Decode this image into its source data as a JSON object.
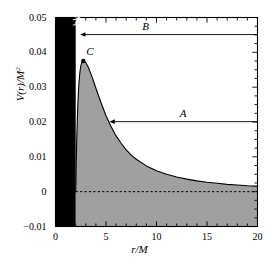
{
  "chart_data": {
    "type": "area",
    "title": "",
    "xlabel": "r/M",
    "ylabel": "V(r)/M2",
    "ylabel_base": "V(r)/M",
    "ylabel_exponent": "2",
    "xlim": [
      0,
      20
    ],
    "ylim": [
      -0.01,
      0.05
    ],
    "xticks": [
      0,
      5,
      10,
      15,
      20
    ],
    "xtick_labels": [
      "0",
      "5",
      "10",
      "15",
      "20"
    ],
    "xticks_minor_step": 1,
    "yticks": [
      -0.01,
      0,
      0.01,
      0.02,
      0.03,
      0.04,
      0.05
    ],
    "ytick_labels": [
      "-0.01",
      "0",
      "0.01",
      "0.02",
      "0.03",
      "0.04",
      "0.05"
    ],
    "yticks_minor_step": 0.0025,
    "grid": false,
    "legend": "none",
    "series": [
      {
        "name": "effective-potential",
        "fill_color": "#a0a0a0",
        "line_color": "#000000",
        "x": [
          2.0,
          2.1,
          2.2,
          2.3,
          2.4,
          2.5,
          2.6,
          2.7,
          2.8,
          2.9,
          3.0,
          3.2,
          3.4,
          3.6,
          3.8,
          4.0,
          4.5,
          5.0,
          5.5,
          6.0,
          6.5,
          7.0,
          7.5,
          8.0,
          9.0,
          10.0,
          11.0,
          12.0,
          13.0,
          14.0,
          15.0,
          16.0,
          17.0,
          18.0,
          19.0,
          20.0
        ],
        "y": [
          0.0,
          0.0148,
          0.0242,
          0.0302,
          0.0339,
          0.036,
          0.0371,
          0.0375,
          0.0375,
          0.0373,
          0.037,
          0.036,
          0.0346,
          0.0331,
          0.0314,
          0.0297,
          0.0256,
          0.0218,
          0.0187,
          0.016,
          0.0139,
          0.012,
          0.0105,
          0.0093,
          0.0074,
          0.006,
          0.005,
          0.0042,
          0.0036,
          0.0031,
          0.0027,
          0.0024,
          0.0021,
          0.0019,
          0.0017,
          0.0016
        ]
      }
    ],
    "zero_line": {
      "name": "zero-reference",
      "y": 0,
      "style": "dashed",
      "color": "#000000"
    },
    "regions": [
      {
        "name": "black-hole",
        "label": "black hole",
        "x_start": 0,
        "x_end": 2.0,
        "color": "#000000",
        "label_color": "#ffffff"
      }
    ],
    "annotations": [
      {
        "name": "arrow-B",
        "label": "B",
        "y": 0.0451,
        "x_from": 20.0,
        "x_to": 2.45,
        "direction": "left",
        "label_x": 8.6
      },
      {
        "name": "arrow-A",
        "label": "A",
        "y": 0.0201,
        "x_from": 20.0,
        "x_to": 5.35,
        "direction": "left",
        "label_x": 12.3
      },
      {
        "name": "point-C",
        "label": "C",
        "x": 2.75,
        "y": 0.0375,
        "marker": "dot",
        "marker_color": "#000000"
      }
    ]
  }
}
